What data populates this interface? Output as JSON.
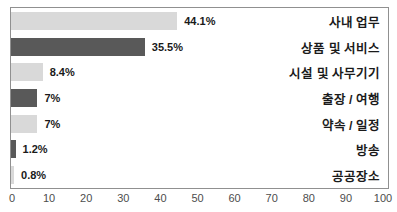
{
  "chart_data": {
    "type": "bar",
    "orientation": "horizontal",
    "title": "",
    "xlabel": "",
    "ylabel": "",
    "xlim": [
      0,
      100
    ],
    "grid": false,
    "legend": false,
    "categories": [
      "사내 업무",
      "상품 및 서비스",
      "시설 및 사무기기",
      "출장 / 여행",
      "약속 / 일정",
      "방송",
      "공공장소"
    ],
    "values": [
      44.1,
      35.5,
      8.4,
      7,
      7,
      1.2,
      0.8
    ],
    "value_labels": [
      "44.1%",
      "35.5%",
      "8.4%",
      "7%",
      "7%",
      "1.2%",
      "0.8%"
    ],
    "bar_colors": [
      "#d9d9d9",
      "#595959",
      "#d9d9d9",
      "#595959",
      "#d9d9d9",
      "#595959",
      "#d9d9d9"
    ],
    "x_ticks": [
      "0",
      "10",
      "20",
      "30",
      "40",
      "50",
      "60",
      "70",
      "80",
      "90",
      "100"
    ]
  },
  "colors": {
    "light_bar": "#d9d9d9",
    "dark_bar": "#595959",
    "border": "#909090",
    "value_text": "#1a1a1a",
    "tick_text": "#4d4d4d",
    "background": "#ffffff"
  }
}
